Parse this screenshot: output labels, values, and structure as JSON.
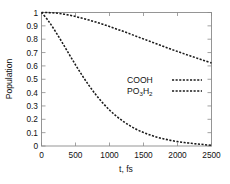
{
  "chart_data": {
    "type": "line",
    "title": "",
    "xlabel": "t, fs",
    "ylabel": "Population",
    "xlim": [
      0,
      2500
    ],
    "ylim": [
      0,
      1
    ],
    "grid": false,
    "legend_position": "center-right",
    "xticks": [
      0,
      500,
      1000,
      1500,
      2000,
      2500
    ],
    "xtick_labels": [
      "0",
      "500",
      "1000",
      "1500",
      "2000",
      "2500"
    ],
    "yticks": [
      0,
      0.1,
      0.2,
      0.3,
      0.4,
      0.5,
      0.6,
      0.7,
      0.8,
      0.9,
      1
    ],
    "ytick_labels": [
      "0",
      "0.1",
      "0.2",
      "0.3",
      "0.4",
      "0.5",
      "0.6",
      "0.7",
      "0.8",
      "0.9",
      "1"
    ],
    "x": [
      0,
      100,
      200,
      300,
      400,
      500,
      600,
      700,
      800,
      900,
      1000,
      1100,
      1200,
      1300,
      1400,
      1500,
      1600,
      1700,
      1800,
      1900,
      2000,
      2100,
      2200,
      2300,
      2400,
      2500
    ],
    "series": [
      {
        "name": "COOH",
        "line_style": "dashed",
        "color": "#1a1a1a",
        "values": [
          1.0,
          0.999,
          0.996,
          0.99,
          0.981,
          0.97,
          0.957,
          0.943,
          0.928,
          0.912,
          0.895,
          0.877,
          0.859,
          0.84,
          0.821,
          0.802,
          0.783,
          0.764,
          0.745,
          0.726,
          0.708,
          0.69,
          0.673,
          0.656,
          0.639,
          0.622
        ]
      },
      {
        "name": "PO3H2",
        "name_display": "PO",
        "name_sub": "3",
        "name_tail": "H",
        "name_tail_sub": "2",
        "line_style": "dashed",
        "color": "#1a1a1a",
        "values": [
          1.0,
          0.938,
          0.862,
          0.779,
          0.693,
          0.608,
          0.527,
          0.452,
          0.384,
          0.323,
          0.27,
          0.224,
          0.185,
          0.152,
          0.124,
          0.101,
          0.082,
          0.066,
          0.053,
          0.042,
          0.033,
          0.026,
          0.02,
          0.015,
          0.01,
          0.005
        ]
      }
    ],
    "legend": [
      {
        "label": "COOH",
        "has_subscripts": false
      },
      {
        "label": "PO3H2",
        "has_subscripts": true,
        "parts": [
          "PO",
          "3",
          "H",
          "2"
        ]
      }
    ]
  }
}
